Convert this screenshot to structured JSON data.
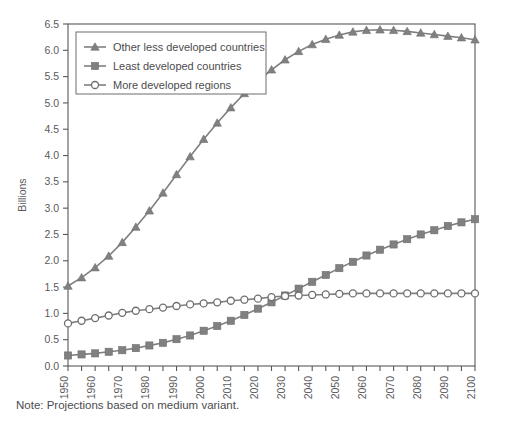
{
  "chart_data": {
    "type": "line",
    "title": "",
    "xlabel": "",
    "ylabel": "Billions",
    "xlim": [
      1950,
      2100
    ],
    "ylim": [
      0.0,
      6.5
    ],
    "ytick_step": 0.5,
    "xtick_step": 5,
    "xlabel_step": 10,
    "grid": false,
    "legend_position": "top-left",
    "note": "Note: Projections based on medium variant.",
    "yticks": [
      "0.0",
      "0.5",
      "1.0",
      "1.5",
      "2.0",
      "2.5",
      "3.0",
      "3.5",
      "4.0",
      "4.5",
      "5.0",
      "5.5",
      "6.0",
      "6.5"
    ],
    "xticks": [
      "1950",
      "1955",
      "1960",
      "1965",
      "1970",
      "1975",
      "1980",
      "1985",
      "1990",
      "1995",
      "2000",
      "2005",
      "2010",
      "2015",
      "2020",
      "2025",
      "2030",
      "2035",
      "2040",
      "2045",
      "2050",
      "2055",
      "2060",
      "2065",
      "2070",
      "2075",
      "2080",
      "2085",
      "2090",
      "2095",
      "2100"
    ],
    "xticklabels": [
      "1950",
      "1960",
      "1970",
      "1980",
      "1990",
      "2000",
      "2010",
      "2020",
      "2030",
      "2040",
      "2050",
      "2060",
      "2070",
      "2080",
      "2090",
      "2100"
    ],
    "x": [
      1950,
      1955,
      1960,
      1965,
      1970,
      1975,
      1980,
      1985,
      1990,
      1995,
      2000,
      2005,
      2010,
      2015,
      2020,
      2025,
      2030,
      2035,
      2040,
      2045,
      2050,
      2055,
      2060,
      2065,
      2070,
      2075,
      2080,
      2085,
      2090,
      2095,
      2100
    ],
    "series": [
      {
        "name": "Other less developed countries",
        "marker": "triangle",
        "color": "#808080",
        "values": [
          1.52,
          1.68,
          1.87,
          2.09,
          2.35,
          2.64,
          2.95,
          3.29,
          3.64,
          3.98,
          4.31,
          4.62,
          4.91,
          5.18,
          5.42,
          5.63,
          5.82,
          5.98,
          6.11,
          6.21,
          6.29,
          6.35,
          6.38,
          6.39,
          6.38,
          6.36,
          6.33,
          6.3,
          6.27,
          6.24,
          6.2
        ]
      },
      {
        "name": "Least developed countries",
        "marker": "square",
        "color": "#808080",
        "values": [
          0.2,
          0.22,
          0.24,
          0.27,
          0.3,
          0.34,
          0.39,
          0.44,
          0.51,
          0.58,
          0.67,
          0.76,
          0.86,
          0.97,
          1.09,
          1.21,
          1.34,
          1.47,
          1.6,
          1.73,
          1.86,
          1.98,
          2.1,
          2.21,
          2.31,
          2.41,
          2.5,
          2.58,
          2.66,
          2.73,
          2.79
        ]
      },
      {
        "name": "More developed regions",
        "marker": "circle",
        "color": "#808080",
        "values": [
          0.81,
          0.86,
          0.91,
          0.96,
          1.01,
          1.05,
          1.08,
          1.11,
          1.14,
          1.17,
          1.19,
          1.21,
          1.24,
          1.26,
          1.28,
          1.31,
          1.33,
          1.34,
          1.35,
          1.36,
          1.37,
          1.38,
          1.38,
          1.38,
          1.38,
          1.38,
          1.38,
          1.38,
          1.38,
          1.38,
          1.38
        ]
      }
    ]
  }
}
